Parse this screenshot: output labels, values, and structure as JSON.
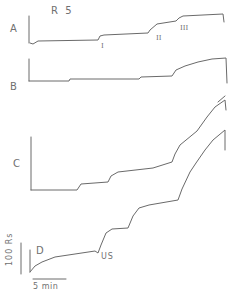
{
  "figure": {
    "title": "R 5",
    "panel_labels": {
      "a": "A",
      "b": "B",
      "c": "C",
      "d": "D"
    },
    "markers": {
      "i": "I",
      "ii": "II",
      "iii": "III",
      "us": "US"
    },
    "scale_bars": {
      "vertical": "100 Rs",
      "horizontal": "5 min"
    }
  },
  "chart_data": {
    "type": "line",
    "title": "R 5",
    "xlabel": "time (scale bar 5 min)",
    "ylabel": "resistance (scale bar 100 Rs)",
    "grid": false,
    "legend": null,
    "annotations": [
      "I",
      "II",
      "III",
      "US"
    ],
    "series": [
      {
        "name": "A",
        "points_px": [
          [
            30,
            43
          ],
          [
            33,
            44
          ],
          [
            38,
            41
          ],
          [
            98,
            40
          ],
          [
            100,
            36
          ],
          [
            104,
            35
          ],
          [
            148,
            33
          ],
          [
            150,
            30
          ],
          [
            157,
            24
          ],
          [
            176,
            21
          ],
          [
            179,
            18
          ],
          [
            183,
            16
          ],
          [
            223,
            14
          ],
          [
            224,
            22
          ]
        ],
        "steps_at_markers": [
          "I",
          "II",
          "III"
        ]
      },
      {
        "name": "B",
        "points_px": [
          [
            29,
            81
          ],
          [
            69,
            81
          ],
          [
            70,
            79
          ],
          [
            139,
            79
          ],
          [
            141,
            77
          ],
          [
            172,
            76
          ],
          [
            176,
            70
          ],
          [
            185,
            66
          ],
          [
            198,
            62
          ],
          [
            212,
            59
          ],
          [
            226,
            58
          ],
          [
            227,
            83
          ]
        ]
      },
      {
        "name": "C",
        "points_px": [
          [
            31,
            190
          ],
          [
            77,
            190
          ],
          [
            81,
            184
          ],
          [
            108,
            182
          ],
          [
            111,
            176
          ],
          [
            118,
            172
          ],
          [
            153,
            168
          ],
          [
            172,
            162
          ],
          [
            175,
            154
          ],
          [
            180,
            145
          ],
          [
            197,
            131
          ],
          [
            207,
            117
          ],
          [
            215,
            107
          ],
          [
            225,
            100
          ],
          [
            226,
            110
          ]
        ]
      },
      {
        "name": "D",
        "points_px": [
          [
            30,
            272
          ],
          [
            35,
            266
          ],
          [
            42,
            262
          ],
          [
            55,
            257
          ],
          [
            95,
            251
          ],
          [
            98,
            253
          ],
          [
            101,
            245
          ],
          [
            106,
            233
          ],
          [
            112,
            229
          ],
          [
            128,
            228
          ],
          [
            133,
            216
          ],
          [
            139,
            208
          ],
          [
            149,
            205
          ],
          [
            178,
            200
          ],
          [
            182,
            189
          ],
          [
            190,
            172
          ],
          [
            196,
            163
          ],
          [
            205,
            150
          ],
          [
            213,
            140
          ],
          [
            225,
            130
          ],
          [
            225,
            150
          ]
        ],
        "annotation": "US"
      }
    ]
  }
}
